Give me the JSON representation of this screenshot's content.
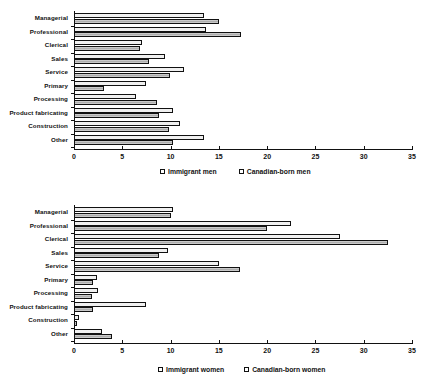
{
  "chart_data": [
    {
      "type": "bar",
      "orientation": "horizontal",
      "title": "",
      "xlabel": "",
      "ylabel": "",
      "xlim": [
        0,
        35
      ],
      "xticks": [
        0,
        5,
        10,
        15,
        20,
        25,
        30,
        35
      ],
      "xtick_labels": [
        "0",
        "5",
        "10",
        "15",
        "20",
        "25",
        "30",
        "35"
      ],
      "grid": false,
      "legend_position": "bottom",
      "categories": [
        "Managerial",
        "Professional",
        "Clerical",
        "Sales",
        "Service",
        "Primary",
        "Processing",
        "Product fabricating",
        "Construction",
        "Other"
      ],
      "series": [
        {
          "name": "Immigrant men",
          "values": [
            13.5,
            13.7,
            7.0,
            9.4,
            11.4,
            7.5,
            6.4,
            10.3,
            11.0,
            13.5
          ]
        },
        {
          "name": "Canadian-born men",
          "values": [
            15.0,
            17.3,
            6.8,
            7.8,
            9.9,
            3.1,
            8.6,
            8.8,
            9.8,
            10.3
          ]
        }
      ]
    },
    {
      "type": "bar",
      "orientation": "horizontal",
      "title": "",
      "xlabel": "",
      "ylabel": "",
      "xlim": [
        0,
        35
      ],
      "xticks": [
        0,
        5,
        10,
        15,
        20,
        25,
        30,
        35
      ],
      "xtick_labels": [
        "0",
        "5",
        "10",
        "15",
        "20",
        "25",
        "30",
        "35"
      ],
      "grid": false,
      "legend_position": "bottom",
      "categories": [
        "Managerial",
        "Professional",
        "Clerical",
        "Sales",
        "Service",
        "Primary",
        "Processing",
        "Product fabricating",
        "Construction",
        "Other"
      ],
      "series": [
        {
          "name": "Immigrant women",
          "values": [
            10.2,
            22.5,
            27.5,
            9.7,
            15.0,
            2.4,
            2.5,
            7.5,
            0.5,
            2.9
          ]
        },
        {
          "name": "Canadian-born women",
          "values": [
            10.0,
            20.0,
            32.5,
            8.8,
            17.2,
            2.0,
            1.9,
            2.0,
            0.3,
            3.9
          ]
        }
      ]
    }
  ],
  "panels": [
    {
      "legend": [
        {
          "label": "Immigrant men",
          "swatch": "open-square-light"
        },
        {
          "label": "Canadian-born men",
          "swatch": "open-square-hatched"
        }
      ]
    },
    {
      "legend": [
        {
          "label": "Immigrant women",
          "swatch": "open-square-light"
        },
        {
          "label": "Canadian-born women",
          "swatch": "open-square-hatched"
        }
      ]
    }
  ]
}
